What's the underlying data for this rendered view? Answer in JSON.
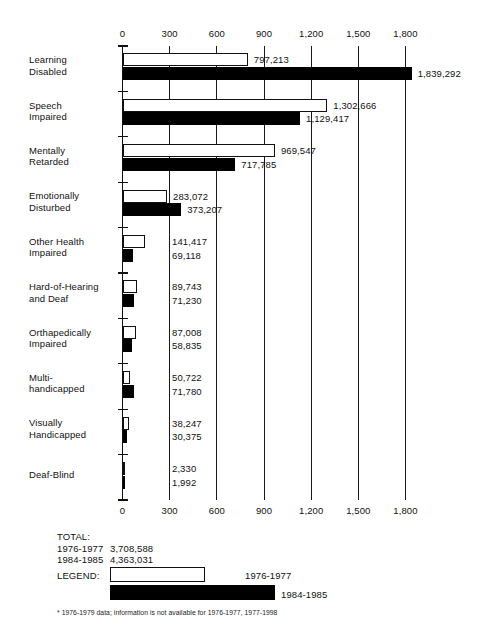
{
  "chart_data": {
    "type": "bar",
    "orientation": "horizontal",
    "title": "",
    "subtitle": "",
    "xlabel": "",
    "ylabel": "",
    "xlim": [
      0,
      1800
    ],
    "unit_note": "values in thousands on axis; data labels show counts",
    "grid": true,
    "legend_position": "bottom",
    "ticks": [
      "0",
      "300",
      "600",
      "900",
      "1,200",
      "1,500",
      "1,800"
    ],
    "tick_values": [
      0,
      300,
      600,
      900,
      1200,
      1500,
      1800
    ],
    "categories": [
      "Learning Disabled",
      "Speech Impaired",
      "Mentally Retarded",
      "Emotionally Disturbed",
      "Other Health Impaired",
      "Hard-of-Hearing and Deaf",
      "Orthapedically Impaired",
      "Multi-handicapped",
      "Visually Handicapped",
      "Deaf-Blind"
    ],
    "category_lines": [
      [
        "Learning",
        "Disabled"
      ],
      [
        "Speech",
        "Impaired"
      ],
      [
        "Mentally",
        "Retarded"
      ],
      [
        "Emotionally",
        "Disturbed"
      ],
      [
        "Other Health",
        "Impaired"
      ],
      [
        "Hard-of-Hearing",
        "and Deaf"
      ],
      [
        "Orthapedically",
        "Impaired"
      ],
      [
        "Multi-",
        "handicapped"
      ],
      [
        "Visually",
        "Handicapped"
      ],
      [
        "Deaf-Blind"
      ]
    ],
    "series": [
      {
        "name": "1976-1977",
        "style": "light",
        "values": [
          797213,
          1302666,
          969547,
          283072,
          141417,
          89743,
          87008,
          50722,
          38247,
          2330
        ],
        "labels": [
          "797,213",
          "1,302,666",
          "969,547",
          "283,072",
          "141,417",
          "89,743",
          "87,008",
          "50,722",
          "38,247",
          "2,330"
        ],
        "total": 3708588,
        "total_label": "3,708,588"
      },
      {
        "name": "1984-1985",
        "style": "dark",
        "values": [
          1839292,
          1129417,
          717785,
          373207,
          69118,
          71230,
          58835,
          71780,
          30375,
          1992
        ],
        "labels": [
          "1,839,292",
          "1,129,417",
          "717,785",
          "373,207",
          "69,118",
          "71,230",
          "58,835",
          "71,780",
          "30,375",
          "1,992"
        ],
        "total": 4363031,
        "total_label": "4,363,031"
      }
    ]
  },
  "totals": {
    "heading": "TOTAL:",
    "rows": [
      {
        "label": "1976-1977",
        "value": "3,708,588"
      },
      {
        "label": "1984-1985",
        "value": "4,363,031"
      }
    ]
  },
  "legend": {
    "heading": "LEGEND:",
    "entries": [
      {
        "label": "1976-1977",
        "style": "light"
      },
      {
        "label": "1984-1985",
        "style": "dark"
      }
    ]
  },
  "footnote": "* 1976-1979 data; information is not available for 1976-1977, 1977-1998",
  "colors": {
    "series_1976_1977": "#ffffff",
    "series_1984_1985": "#000000",
    "axis": "#111111",
    "background": "#ffffff"
  }
}
